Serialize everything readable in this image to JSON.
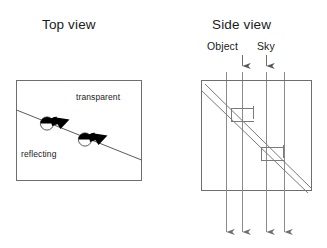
{
  "figure": {
    "panels": [
      {
        "id": "top-view",
        "title": "Top view",
        "zone_labels": {
          "upper": "transparent",
          "lower": "reflecting"
        },
        "box": {
          "x": 16,
          "y": 80,
          "width": 125,
          "height": 100
        },
        "boundary_line": {
          "x1": 16,
          "y1": 110,
          "x2": 141,
          "y2": 160
        },
        "markers": [
          {
            "id": "marker-1",
            "cx": 47,
            "cy": 123,
            "r": 6.5,
            "wedge_tip_x": 70,
            "wedge_tip_y": 119
          },
          {
            "id": "marker-2",
            "cx": 85,
            "cy": 139,
            "r": 6.5,
            "wedge_tip_x": 108,
            "wedge_tip_y": 135
          }
        ]
      },
      {
        "id": "side-view",
        "title": "Side view",
        "box": {
          "x": 201,
          "y": 80,
          "width": 110,
          "height": 110
        },
        "slab": {
          "upper_line": {
            "x1": 205,
            "y1": 84,
            "x2": 311,
            "y2": 188
          },
          "lower_line": {
            "x1": 201,
            "y1": 90,
            "x2": 307,
            "y2": 192
          }
        },
        "incoming_rays": [
          {
            "label": "Object",
            "x": 242,
            "y_start": 55,
            "y_end": 67
          },
          {
            "label": "Sky",
            "x": 266,
            "y_start": 55,
            "y_end": 67
          }
        ],
        "through_rays_x": [
          226,
          242,
          266,
          284
        ],
        "exit_arrows": [
          {
            "x": 226,
            "y_start": 190,
            "y_end": 234
          },
          {
            "x": 242,
            "y_start": 190,
            "y_end": 234
          },
          {
            "x": 266,
            "y_start": 190,
            "y_end": 234
          },
          {
            "x": 284,
            "y_start": 190,
            "y_end": 234
          }
        ],
        "steps": [
          {
            "id": "step-upper",
            "x": 232,
            "y": 108,
            "width": 22,
            "height": 13
          },
          {
            "id": "step-lower",
            "x": 262,
            "y": 147,
            "width": 22,
            "height": 13
          }
        ]
      }
    ],
    "colors": {
      "stroke": "#6e6e6e",
      "stroke_dark": "#3a3a3a",
      "marker_fill": "#000000",
      "text": "#1a1a1a",
      "background": "#ffffff"
    }
  }
}
